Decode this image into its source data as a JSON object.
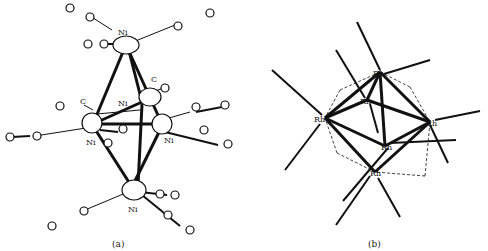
{
  "figure": {
    "panels": [
      {
        "id": "a",
        "caption": "(a)",
        "metal": "Ni",
        "description": "Ni6(CO)12 octahedral-like cluster with terminal and bridging carbonyls",
        "atom_labels": {
          "ni_top": "Ni",
          "ni_mid_center": "Ni",
          "ni_left": "Ni",
          "ni_right": "Ni",
          "ni_bottom": "Ni",
          "c_top_left": "C",
          "c_mid": "C",
          "c_left": "C"
        }
      },
      {
        "id": "b",
        "caption": "(b)",
        "metal": "Rh",
        "description": "Rh6(CO)16 octahedral cluster with terminal and face-bridging carbonyls",
        "atom_labels": {
          "rh_top": "Rh",
          "rh_upper_mid": "Rh",
          "rh_left": "Rh",
          "rh_right": "Rh",
          "rh_center": "Rh",
          "rh_bottom": "Rh"
        }
      }
    ],
    "symbols": {
      "carbon": "C",
      "oxygen": "O"
    }
  }
}
